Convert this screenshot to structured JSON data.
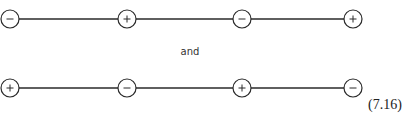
{
  "rows": [
    {
      "y": 19,
      "charges": [
        {
          "x": 10,
          "sign": "-"
        },
        {
          "x": 127,
          "sign": "+"
        },
        {
          "x": 242,
          "sign": "-"
        },
        {
          "x": 353,
          "sign": "+"
        }
      ]
    },
    {
      "y": 88,
      "charges": [
        {
          "x": 10,
          "sign": "+"
        },
        {
          "x": 127,
          "sign": "-"
        },
        {
          "x": 242,
          "sign": "+"
        },
        {
          "x": 353,
          "sign": "-"
        }
      ]
    }
  ],
  "connector_text": "and",
  "equation_number": "(7.16)",
  "colors": {
    "stroke": "#2a2a2a"
  }
}
